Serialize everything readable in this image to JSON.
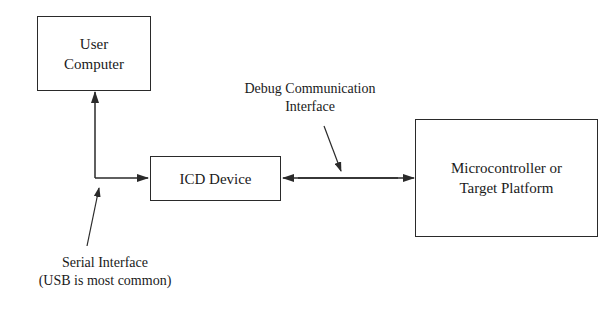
{
  "diagram": {
    "nodes": {
      "user_computer": {
        "label_line1": "User",
        "label_line2": "Computer"
      },
      "icd_device": {
        "label": "ICD Device"
      },
      "target": {
        "label_line1": "Microcontroller or",
        "label_line2": "Target Platform"
      }
    },
    "annotations": {
      "debug_interface": {
        "line1": "Debug Communication",
        "line2": "Interface"
      },
      "serial_interface": {
        "line1": "Serial Interface",
        "line2": "(USB is most common)"
      }
    },
    "edges": [
      {
        "from": "icd_device",
        "to": "user_computer",
        "type": "serial",
        "arrow": "single"
      },
      {
        "from": "icd_device",
        "to": "target",
        "type": "debug",
        "arrow": "double"
      }
    ],
    "colors": {
      "stroke": "#2a2a2a",
      "background": "#ffffff"
    }
  }
}
